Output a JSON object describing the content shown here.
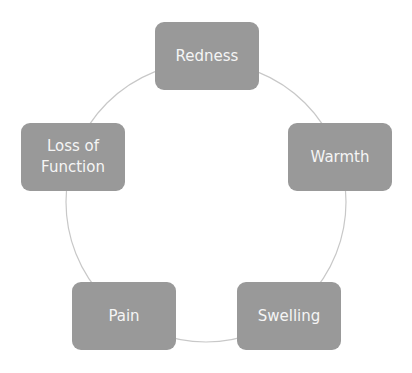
{
  "diagram": {
    "type": "basic-cycle",
    "colors": {
      "node_fill": "#999999",
      "node_text": "#f5f5f5",
      "connector": "#c8c8c8",
      "background": "#ffffff"
    },
    "cycle": {
      "cx": 206,
      "cy": 202,
      "r": 140
    },
    "nodes": [
      {
        "label": "Redness",
        "x": 155,
        "y": 22
      },
      {
        "label": "Warmth",
        "x": 288,
        "y": 123
      },
      {
        "label": "Swelling",
        "x": 237,
        "y": 282
      },
      {
        "label": "Pain",
        "x": 72,
        "y": 282
      },
      {
        "label": "Loss of\nFunction",
        "x": 21,
        "y": 123
      }
    ]
  }
}
